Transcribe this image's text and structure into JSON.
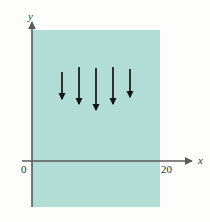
{
  "figure": {
    "background_color": "#fdfdfb"
  },
  "chart_data": {
    "type": "scatter",
    "title": "",
    "subtitle": "",
    "xlabel": "x",
    "ylabel": "y",
    "legend": [],
    "grid": false,
    "xlim": [
      0,
      20
    ],
    "ylim": [
      0,
      1
    ],
    "x_tick_labels": [
      "0",
      "20"
    ],
    "x_tick_values": [
      0,
      20
    ],
    "y_tick_labels": [],
    "y_tick_values": [],
    "axis_color": "#5a5a5a",
    "shaded_region": {
      "name": "domain-rectangle",
      "fill_color": "#b2dcd6",
      "x_start": 0,
      "x_end": 20,
      "extends_above_axis": true,
      "extends_below_axis": true
    },
    "vectors": {
      "name": "downward-arrows",
      "count": 5,
      "direction": "down",
      "color": "#141414",
      "items": [
        {
          "id": "arrow-1",
          "x1": 62,
          "y1": 72,
          "x2": 62,
          "y2": 99
        },
        {
          "id": "arrow-2",
          "x1": 79,
          "y1": 67,
          "x2": 79,
          "y2": 104
        },
        {
          "id": "arrow-3",
          "x1": 96,
          "y1": 68,
          "x2": 96,
          "y2": 110
        },
        {
          "id": "arrow-4",
          "x1": 113,
          "y1": 67,
          "x2": 113,
          "y2": 104
        },
        {
          "id": "arrow-5",
          "x1": 130,
          "y1": 69,
          "x2": 130,
          "y2": 97
        }
      ]
    },
    "geometry": {
      "rect_left": 32,
      "rect_right": 160,
      "rect_top": 30,
      "rect_bottom": 207,
      "y_axis_x": 32,
      "y_axis_top": 22,
      "y_axis_bottom": 207,
      "x_axis_y": 161,
      "x_axis_left": 22,
      "x_axis_right": 192
    }
  },
  "labels": {
    "y_axis": "y",
    "x_axis": "x",
    "origin": "0",
    "right_bound": "20"
  }
}
